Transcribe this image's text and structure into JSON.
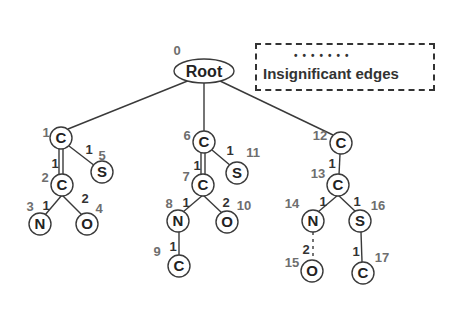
{
  "legend": {
    "dots": "•••••••",
    "label": "Insignificant edges"
  },
  "colors": {
    "stroke": "#3a3a3a",
    "label_gray": "#6e6e6e",
    "background": "#ffffff"
  },
  "root": {
    "id": "0",
    "label": "Root"
  },
  "nodes": [
    {
      "id": "1",
      "atom": "C"
    },
    {
      "id": "2",
      "atom": "C"
    },
    {
      "id": "3",
      "atom": "N"
    },
    {
      "id": "4",
      "atom": "O"
    },
    {
      "id": "5",
      "atom": "S"
    },
    {
      "id": "6",
      "atom": "C"
    },
    {
      "id": "7",
      "atom": "C"
    },
    {
      "id": "8",
      "atom": "N"
    },
    {
      "id": "9",
      "atom": "C"
    },
    {
      "id": "10",
      "atom": "O"
    },
    {
      "id": "11",
      "atom": "S"
    },
    {
      "id": "12",
      "atom": "C"
    },
    {
      "id": "13",
      "atom": "C"
    },
    {
      "id": "14",
      "atom": "N"
    },
    {
      "id": "15",
      "atom": "O"
    },
    {
      "id": "16",
      "atom": "S"
    },
    {
      "id": "17",
      "atom": "C"
    }
  ],
  "edges": [
    {
      "from": "0",
      "to": "1",
      "label": ""
    },
    {
      "from": "0",
      "to": "6",
      "label": ""
    },
    {
      "from": "0",
      "to": "12",
      "label": ""
    },
    {
      "from": "1",
      "to": "2",
      "label": "1"
    },
    {
      "from": "1",
      "to": "5",
      "label": "1"
    },
    {
      "from": "2",
      "to": "3",
      "label": "1"
    },
    {
      "from": "2",
      "to": "4",
      "label": "2"
    },
    {
      "from": "6",
      "to": "7",
      "label": "1"
    },
    {
      "from": "6",
      "to": "11",
      "label": "1"
    },
    {
      "from": "7",
      "to": "8",
      "label": "1"
    },
    {
      "from": "7",
      "to": "10",
      "label": "2"
    },
    {
      "from": "8",
      "to": "9",
      "label": "1"
    },
    {
      "from": "12",
      "to": "13",
      "label": "1"
    },
    {
      "from": "13",
      "to": "14",
      "label": "1"
    },
    {
      "from": "13",
      "to": "16",
      "label": "1"
    },
    {
      "from": "14",
      "to": "15",
      "label": "2"
    },
    {
      "from": "16",
      "to": "17",
      "label": "1"
    }
  ]
}
